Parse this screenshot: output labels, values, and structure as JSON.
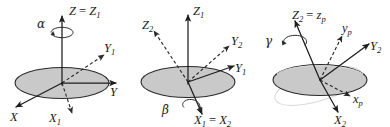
{
  "figure": {
    "background_color": "#ffffff",
    "disk_fill_color": "#c9c9c9",
    "disk_stroke_color": "#2a2a2a",
    "axis_color": "#1d1d1d",
    "ghost_color": "#d9d9d9"
  },
  "panels": [
    {
      "id": "panel-alpha",
      "name": "first-rotation-alpha",
      "angle_symbol": "α",
      "rotation_axis": "Z = Z1",
      "labels": {
        "vertical_axis": {
          "base": "Z",
          "eq": " = ",
          "second": "Z",
          "second_sub": "1"
        },
        "y_axis": {
          "base": "Y",
          "sub": ""
        },
        "y1_axis": {
          "base": "Y",
          "sub": "1"
        },
        "x_axis": {
          "base": "X",
          "sub": ""
        },
        "x1_axis": {
          "base": "X",
          "sub": "1"
        },
        "angle": "α"
      }
    },
    {
      "id": "panel-beta",
      "name": "second-rotation-beta",
      "angle_symbol": "β",
      "rotation_axis": "X1 = X2",
      "labels": {
        "z1_axis": {
          "base": "Z",
          "sub": "1"
        },
        "z2_axis": {
          "base": "Z",
          "sub": "2"
        },
        "y1_axis": {
          "base": "Y",
          "sub": "1"
        },
        "y2_axis": {
          "base": "Y",
          "sub": "2"
        },
        "x_axis": {
          "base": "X",
          "sub": "1",
          "eq": " = ",
          "second": "X",
          "second_sub": "2"
        },
        "angle": "β"
      }
    },
    {
      "id": "panel-gamma",
      "name": "third-rotation-gamma",
      "angle_symbol": "γ",
      "rotation_axis": "Z2 = zp",
      "labels": {
        "z_axis": {
          "base": "Z",
          "sub": "2",
          "eq": " = ",
          "second": "z",
          "second_sub": "p"
        },
        "yp_axis": {
          "base": "y",
          "sub": "p"
        },
        "y2_axis": {
          "base": "Y",
          "sub": "2"
        },
        "xp_axis": {
          "base": "x",
          "sub": "p"
        },
        "x2_axis": {
          "base": "X",
          "sub": "2"
        },
        "angle": "γ"
      }
    }
  ]
}
